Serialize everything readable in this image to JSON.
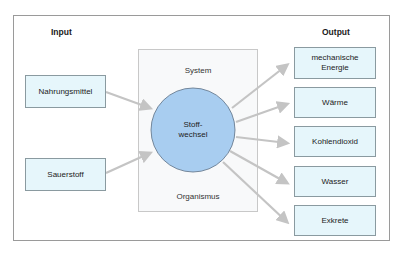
{
  "diagram": {
    "input_label": "Input",
    "output_label": "Output",
    "inputs": [
      {
        "label": "Nahrungsmittel"
      },
      {
        "label": "Sauerstoff"
      }
    ],
    "system": {
      "top_label": "System",
      "bottom_label": "Organismus",
      "process_line1": "Stoff-",
      "process_line2": "wechsel"
    },
    "outputs": [
      {
        "label": "mechanische Energie"
      },
      {
        "label": "Wärme"
      },
      {
        "label": "Kohlendioxid"
      },
      {
        "label": "Wasser"
      },
      {
        "label": "Exkrete"
      }
    ],
    "colors": {
      "box_fill": "#e6f6fb",
      "circle_fill": "#a8cdf0",
      "circle_stroke": "#5a6e84",
      "arrow": "#c4c4c4",
      "system_fill": "#f8f9fa"
    }
  }
}
